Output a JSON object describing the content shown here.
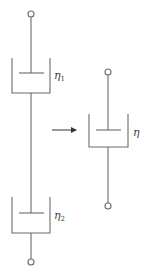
{
  "diagram": {
    "left_system": {
      "dashpots": [
        {
          "label": "η",
          "subscript": "1"
        },
        {
          "label": "η",
          "subscript": "2"
        }
      ]
    },
    "arrow": {
      "direction": "right"
    },
    "right_system": {
      "dashpot": {
        "label": "η",
        "subscript": ""
      }
    },
    "colors": {
      "stroke": "#6b6b6b",
      "text": "#444444",
      "background": "#ffffff"
    }
  }
}
